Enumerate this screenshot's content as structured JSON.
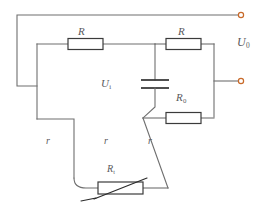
{
  "figure": {
    "type": "schematic",
    "background_color": "#ffffff",
    "wire_color": "#6f6f6f",
    "component_color": "#3b3b3b",
    "terminal_color": "#c86a2a",
    "label_color": "#59595c"
  },
  "labels": {
    "resistor_top_left": "R",
    "resistor_top_right": "R",
    "output_voltage": "U",
    "output_voltage_sub": "0",
    "capacitor_voltage": "U",
    "capacitor_voltage_sub": "i",
    "resistor_r0": "R",
    "resistor_r0_sub": "0",
    "lead_r_left": "r",
    "lead_r_middle": "r",
    "lead_r_right": "r",
    "thermistor": "R",
    "thermistor_sub": "t"
  },
  "components": [
    {
      "name": "resistor-top-left",
      "label": "R",
      "kind": "resistor"
    },
    {
      "name": "resistor-top-right",
      "label": "R",
      "kind": "resistor"
    },
    {
      "name": "resistor-r0",
      "label": "R0",
      "kind": "resistor"
    },
    {
      "name": "thermistor",
      "label": "Rt",
      "kind": "variable-resistor"
    },
    {
      "name": "capacitor",
      "label": "Ui",
      "kind": "capacitor"
    }
  ],
  "terminals": [
    {
      "name": "output-terminal-top",
      "position": "top-right"
    },
    {
      "name": "output-terminal-bottom",
      "position": "middle-right"
    }
  ]
}
